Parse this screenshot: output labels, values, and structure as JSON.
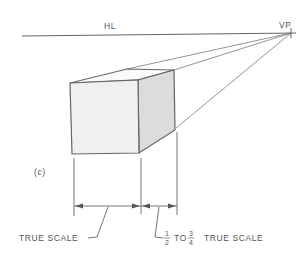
{
  "diagram": {
    "horizon_label": "HL",
    "vanishing_point_label": "VP",
    "figure_label": "(c)",
    "true_scale_label": "TRUE SCALE",
    "fraction_numerator_1": "1",
    "fraction_denominator_1": "2",
    "to_label": "TO",
    "fraction_numerator_2": "3",
    "fraction_denominator_2": "4",
    "foreshortened_scale_label": "TRUE SCALE",
    "colors": {
      "line": "#666666",
      "front_face": "#f0f0f0",
      "side_face": "#dcdcdc",
      "top_face": "#fafafa",
      "text": "#555555"
    }
  }
}
